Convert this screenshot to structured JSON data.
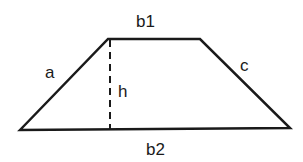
{
  "diagram": {
    "labels": {
      "top_base": "b1",
      "bottom_base": "b2",
      "left_side": "a",
      "right_side": "c",
      "height": "h"
    },
    "colors": {
      "stroke": "#1a1a1a",
      "background": "#ffffff"
    }
  }
}
